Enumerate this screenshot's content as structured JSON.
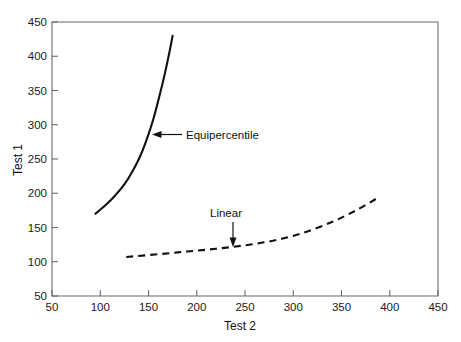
{
  "chart_data": {
    "type": "line",
    "title": "",
    "xlabel": "Test 2",
    "ylabel": "Test 1",
    "xlim": [
      50,
      450
    ],
    "ylim": [
      50,
      450
    ],
    "xticks": [
      50,
      100,
      150,
      200,
      250,
      300,
      350,
      400,
      450
    ],
    "xticklabels": [
      "50",
      "100",
      "150",
      "200",
      "250",
      "300",
      "350",
      "400",
      "450"
    ],
    "yticks": [
      50,
      100,
      150,
      200,
      250,
      300,
      350,
      400,
      450
    ],
    "yticklabels": [
      "50",
      "100",
      "150",
      "200",
      "250",
      "300",
      "350",
      "400",
      "450"
    ],
    "grid": false,
    "legend": "annotations",
    "series": [
      {
        "name": "Equipercentile",
        "style": "solid",
        "x": [
          95,
          105,
          115,
          125,
          133,
          141,
          148,
          155,
          161,
          167,
          172,
          175
        ],
        "y": [
          170,
          182,
          196,
          213,
          231,
          253,
          278,
          308,
          340,
          375,
          408,
          430
        ]
      },
      {
        "name": "Linear",
        "style": "dashed",
        "x": [
          127,
          160,
          190,
          220,
          250,
          280,
          310,
          340,
          365,
          386
        ],
        "y": [
          107,
          111,
          115,
          119,
          124,
          131,
          142,
          158,
          175,
          192
        ]
      }
    ],
    "annotations": [
      {
        "label": "Equipercentile",
        "target_x": 148,
        "target_y": 283,
        "arrow_direction": "left"
      },
      {
        "label": "Linear",
        "target_x": 233,
        "target_y": 121,
        "arrow_direction": "down"
      }
    ]
  },
  "axes": {
    "x_title": "Test 2",
    "y_title": "Test 1"
  }
}
